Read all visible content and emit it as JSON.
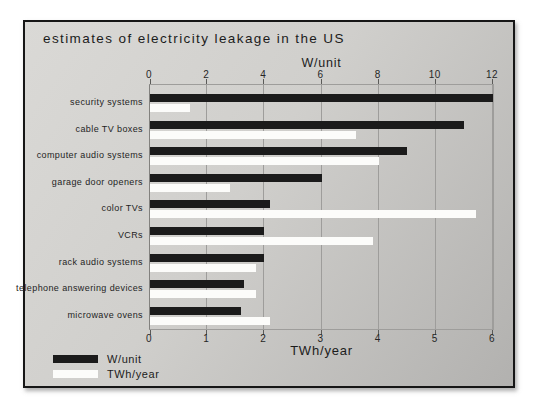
{
  "title": "estimates of electricity leakage in the US",
  "chart_data": {
    "type": "bar",
    "orientation": "horizontal",
    "title": "estimates of electricity leakage in the US",
    "categories": [
      "security systems",
      "cable TV boxes",
      "computer audio systems",
      "garage door openers",
      "color TVs",
      "VCRs",
      "rack audio systems",
      "telephone answering devices",
      "microwave ovens"
    ],
    "series": [
      {
        "name": "W/unit",
        "axis": "top",
        "color": "#1b1b1b",
        "values": [
          12,
          11,
          9,
          6,
          4.2,
          4,
          4,
          3.3,
          3.2
        ]
      },
      {
        "name": "TWh/year",
        "axis": "bottom",
        "color": "#fcfcfa",
        "values": [
          0.7,
          3.6,
          4.0,
          1.4,
          5.7,
          3.9,
          1.85,
          1.85,
          2.1
        ]
      }
    ],
    "top_axis": {
      "label": "W/unit",
      "min": 0,
      "max": 12,
      "ticks": [
        0,
        2,
        4,
        6,
        8,
        10,
        12
      ]
    },
    "bottom_axis": {
      "label": "TWh/year",
      "min": 0,
      "max": 6,
      "ticks": [
        0,
        1,
        2,
        3,
        4,
        5,
        6
      ]
    },
    "grid": true,
    "legend_position": "bottom-left"
  },
  "legend": {
    "items": [
      {
        "label": "W/unit",
        "color": "#1b1b1b"
      },
      {
        "label": "TWh/year",
        "color": "#fcfcfa"
      }
    ]
  },
  "colors": {
    "frame_border": "#161616",
    "background_light": "#dad9d6",
    "background_dark": "#b2b1af",
    "gridline": "#9e9d9b",
    "bar_black": "#1b1b1b",
    "bar_white": "#fcfcfa",
    "text": "#1c1c1c",
    "page": "#ffffff"
  }
}
